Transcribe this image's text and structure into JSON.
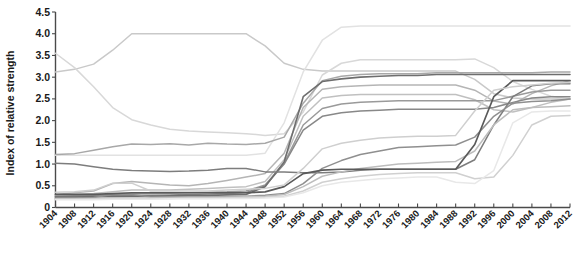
{
  "chart_data": {
    "type": "line",
    "title": "",
    "xlabel": "",
    "ylabel": "Index of relative strength",
    "xlim": [
      1904,
      2012
    ],
    "ylim": [
      0,
      4.5
    ],
    "grid": false,
    "legend": "none",
    "x": [
      1904,
      1908,
      1912,
      1916,
      1920,
      1924,
      1928,
      1932,
      1936,
      1940,
      1944,
      1948,
      1952,
      1956,
      1960,
      1964,
      1968,
      1972,
      1976,
      1980,
      1984,
      1988,
      1992,
      1996,
      2000,
      2004,
      2008,
      2012
    ],
    "ytick_labels": [
      "0",
      "0.5",
      "1.0",
      "1.5",
      "2.0",
      "2.5",
      "3.0",
      "3.5",
      "4.0",
      "4.5"
    ],
    "ytick_values": [
      0,
      0.5,
      1.0,
      1.5,
      2.0,
      2.5,
      3.0,
      3.5,
      4.0,
      4.5
    ],
    "xtick_labels": [
      "1904",
      "1908",
      "1912",
      "1916",
      "1920",
      "1924",
      "1928",
      "1932",
      "1936",
      "1940",
      "1944",
      "1948",
      "1952",
      "1956",
      "1960",
      "1964",
      "1968",
      "1972",
      "1976",
      "1980",
      "1984",
      "1988",
      "1992",
      "1996",
      "2000",
      "2004",
      "2008",
      "2012"
    ],
    "series": [
      {
        "name": "series-1",
        "color": "#c9c9c9",
        "width": 1.5,
        "values": [
          3.12,
          3.18,
          3.3,
          3.62,
          4.0,
          4.0,
          4.0,
          4.0,
          4.0,
          4.0,
          4.0,
          3.72,
          3.32,
          3.18,
          3.14,
          3.14,
          3.14,
          3.14,
          3.14,
          3.14,
          3.14,
          3.14,
          2.95,
          2.62,
          2.52,
          2.5,
          2.5,
          2.5
        ]
      },
      {
        "name": "series-2",
        "color": "#d8d8d8",
        "width": 1.5,
        "values": [
          3.55,
          3.22,
          2.78,
          2.3,
          2.02,
          1.9,
          1.8,
          1.76,
          1.74,
          1.72,
          1.7,
          1.66,
          1.7,
          2.2,
          3.05,
          3.32,
          3.4,
          3.4,
          3.4,
          3.4,
          3.4,
          3.4,
          3.42,
          3.22,
          2.9,
          2.72,
          2.56,
          2.5
        ]
      },
      {
        "name": "series-3",
        "color": "#e2e2e2",
        "width": 1.5,
        "values": [
          1.2,
          1.2,
          1.2,
          1.2,
          1.2,
          1.2,
          1.2,
          1.2,
          1.2,
          1.2,
          1.2,
          1.25,
          1.95,
          3.12,
          3.85,
          4.15,
          4.18,
          4.18,
          4.18,
          4.18,
          4.18,
          4.18,
          4.18,
          4.18,
          4.18,
          4.18,
          4.18,
          4.18
        ]
      },
      {
        "name": "series-4",
        "color": "#a8a8a8",
        "width": 1.5,
        "values": [
          1.22,
          1.24,
          1.32,
          1.4,
          1.46,
          1.45,
          1.47,
          1.44,
          1.48,
          1.46,
          1.45,
          1.48,
          1.62,
          2.4,
          2.92,
          3.02,
          3.06,
          3.08,
          3.08,
          3.08,
          3.1,
          3.1,
          3.1,
          3.1,
          3.1,
          3.1,
          3.12,
          3.12
        ]
      },
      {
        "name": "series-5",
        "color": "#b5b5b5",
        "width": 1.5,
        "values": [
          0.3,
          0.34,
          0.38,
          0.55,
          0.6,
          0.56,
          0.52,
          0.5,
          0.55,
          0.62,
          0.7,
          0.78,
          1.25,
          2.3,
          2.72,
          2.78,
          2.8,
          2.82,
          2.82,
          2.82,
          2.82,
          2.82,
          2.7,
          2.45,
          2.38,
          2.62,
          2.8,
          2.92
        ]
      },
      {
        "name": "series-6",
        "color": "#c0c0c0",
        "width": 1.5,
        "values": [
          0.28,
          0.3,
          0.32,
          0.36,
          0.4,
          0.4,
          0.4,
          0.42,
          0.44,
          0.46,
          0.48,
          0.6,
          1.1,
          2.1,
          2.52,
          2.58,
          2.6,
          2.6,
          2.6,
          2.6,
          2.6,
          2.6,
          2.48,
          2.25,
          2.2,
          2.3,
          2.42,
          2.5
        ]
      },
      {
        "name": "series-7",
        "color": "#9a9a9a",
        "width": 1.5,
        "values": [
          0.26,
          0.27,
          0.28,
          0.3,
          0.32,
          0.32,
          0.33,
          0.34,
          0.35,
          0.36,
          0.38,
          0.52,
          1.02,
          1.9,
          2.28,
          2.38,
          2.42,
          2.44,
          2.46,
          2.46,
          2.46,
          2.46,
          2.46,
          2.46,
          2.56,
          2.66,
          2.7,
          2.7
        ]
      },
      {
        "name": "series-8",
        "color": "#888888",
        "width": 1.5,
        "values": [
          0.25,
          0.26,
          0.26,
          0.27,
          0.28,
          0.28,
          0.29,
          0.3,
          0.31,
          0.32,
          0.34,
          0.5,
          1.0,
          1.78,
          2.1,
          2.18,
          2.22,
          2.24,
          2.26,
          2.26,
          2.26,
          2.26,
          2.26,
          2.3,
          2.42,
          2.52,
          2.55,
          2.55
        ]
      },
      {
        "name": "series-9",
        "color": "#6e6e6e",
        "width": 1.6,
        "values": [
          0.24,
          0.24,
          0.25,
          0.25,
          0.26,
          0.26,
          0.27,
          0.28,
          0.28,
          0.29,
          0.3,
          0.48,
          1.05,
          2.55,
          2.9,
          2.96,
          3.0,
          3.02,
          3.04,
          3.04,
          3.06,
          3.06,
          3.06,
          3.06,
          3.06,
          3.06,
          3.06,
          3.06
        ]
      },
      {
        "name": "series-10",
        "color": "#7d7d7d",
        "width": 1.5,
        "values": [
          1.02,
          1.0,
          0.94,
          0.88,
          0.85,
          0.84,
          0.83,
          0.84,
          0.86,
          0.9,
          0.9,
          0.82,
          0.82,
          0.8,
          0.8,
          0.82,
          0.86,
          0.88,
          0.88,
          0.88,
          0.88,
          0.88,
          1.1,
          1.9,
          2.55,
          2.8,
          2.85,
          2.85
        ]
      },
      {
        "name": "series-11",
        "color": "#8f8f8f",
        "width": 1.5,
        "values": [
          0.22,
          0.22,
          0.23,
          0.3,
          0.3,
          0.24,
          0.24,
          0.24,
          0.24,
          0.25,
          0.26,
          0.28,
          0.32,
          0.55,
          0.9,
          1.08,
          1.22,
          1.3,
          1.38,
          1.4,
          1.42,
          1.44,
          1.62,
          2.1,
          2.4,
          2.44,
          2.46,
          2.5
        ]
      },
      {
        "name": "series-12",
        "color": "#bdbdbd",
        "width": 1.5,
        "values": [
          0.2,
          0.2,
          0.21,
          0.22,
          0.22,
          0.22,
          0.22,
          0.23,
          0.23,
          0.24,
          0.25,
          0.26,
          0.3,
          0.48,
          0.72,
          0.82,
          0.9,
          0.95,
          1.0,
          1.02,
          1.04,
          1.06,
          1.3,
          1.9,
          2.25,
          2.3,
          2.32,
          2.34
        ]
      },
      {
        "name": "series-13",
        "color": "#d0d0d0",
        "width": 1.5,
        "values": [
          0.19,
          0.19,
          0.2,
          0.21,
          0.21,
          0.21,
          0.21,
          0.22,
          0.22,
          0.22,
          0.23,
          0.24,
          0.26,
          0.38,
          0.58,
          0.66,
          0.72,
          0.76,
          0.78,
          0.8,
          0.8,
          0.8,
          0.66,
          0.7,
          1.2,
          1.9,
          2.1,
          2.12
        ]
      },
      {
        "name": "series-14",
        "color": "#5a5a5a",
        "width": 1.7,
        "values": [
          0.3,
          0.3,
          0.3,
          0.32,
          0.34,
          0.34,
          0.34,
          0.34,
          0.34,
          0.34,
          0.34,
          0.36,
          0.48,
          0.78,
          0.86,
          0.88,
          0.88,
          0.88,
          0.88,
          0.88,
          0.88,
          0.88,
          1.45,
          2.55,
          2.92,
          2.92,
          2.92,
          2.92
        ]
      },
      {
        "name": "series-15",
        "color": "#cfcfcf",
        "width": 1.5,
        "values": [
          0.35,
          0.36,
          0.4,
          0.56,
          0.56,
          0.38,
          0.38,
          0.38,
          0.38,
          0.4,
          0.42,
          0.44,
          0.52,
          0.9,
          1.35,
          1.48,
          1.55,
          1.6,
          1.62,
          1.64,
          1.64,
          1.66,
          2.22,
          2.7,
          2.78,
          2.82,
          2.86,
          2.88
        ]
      },
      {
        "name": "series-16",
        "color": "#e8e8e8",
        "width": 1.5,
        "values": [
          0.18,
          0.18,
          0.18,
          0.19,
          0.19,
          0.19,
          0.2,
          0.2,
          0.2,
          0.21,
          0.21,
          0.22,
          0.24,
          0.34,
          0.5,
          0.58,
          0.62,
          0.66,
          0.68,
          0.7,
          0.7,
          0.58,
          0.55,
          0.85,
          1.95,
          2.2,
          2.22,
          2.22
        ]
      }
    ]
  }
}
